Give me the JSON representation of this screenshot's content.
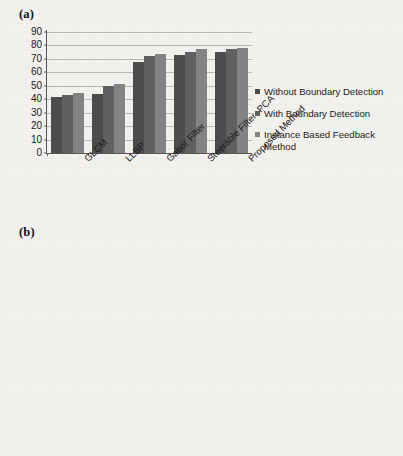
{
  "figure": {
    "panel_a_label": "(a)",
    "panel_b_label": "(b)"
  },
  "colors": {
    "series_without_boundary": "#4c4c4c",
    "series_with_boundary": "#606060",
    "series_instance_feedback": "#838383",
    "gridline": "#b9b7b4",
    "axis": "#555555",
    "page_background": "#f3f1ee"
  },
  "legend": {
    "items": [
      {
        "label": "Without Boundary Detection",
        "color": "#4c4c4c"
      },
      {
        "label": "With Boundary Detection",
        "color": "#606060"
      },
      {
        "label": "Instance Based  Feedback Method",
        "color": "#838383"
      }
    ]
  },
  "chart_data": [
    {
      "id": "chart-a",
      "type": "bar",
      "title": "(a)",
      "xlabel": "",
      "ylabel": "",
      "ylim": [
        0,
        90
      ],
      "yticks": [
        0,
        10,
        20,
        30,
        40,
        50,
        60,
        70,
        80,
        90
      ],
      "grid": true,
      "legend_position": "right",
      "categories": [
        "GLCM",
        "LLBP",
        "Gabor Filter",
        "Steerable Filter+PCA",
        "Proposed Method"
      ],
      "series": [
        {
          "name": "Without Boundary Detection",
          "values": [
            42,
            44,
            68,
            73,
            75
          ]
        },
        {
          "name": "With Boundary Detection",
          "values": [
            43,
            50,
            72.5,
            75.5,
            77
          ]
        },
        {
          "name": "Instance Based  Feedback Method",
          "values": [
            45,
            51,
            74,
            77,
            78
          ]
        }
      ]
    },
    {
      "id": "chart-b",
      "type": "bar",
      "title": "(b)",
      "xlabel": "",
      "ylabel": "",
      "ylim": [
        0,
        70
      ],
      "yticks": [
        0,
        10,
        20,
        30,
        40,
        50,
        60,
        70
      ],
      "grid": true,
      "legend_position": "right",
      "categories": [
        "GLCM",
        "LLBP",
        "Gabor Filter",
        "Steerable Filter+PCA",
        "Proposed Method"
      ],
      "series": [
        {
          "name": "Without Boundary Detection",
          "values": [
            58,
            56,
            32,
            27,
            25
          ]
        },
        {
          "name": "With Boundary Detection",
          "values": [
            57,
            50,
            26.5,
            24,
            23
          ]
        },
        {
          "name": "Instance Based  Feedback Method",
          "values": [
            55,
            49,
            25.5,
            23,
            22
          ]
        }
      ]
    }
  ]
}
